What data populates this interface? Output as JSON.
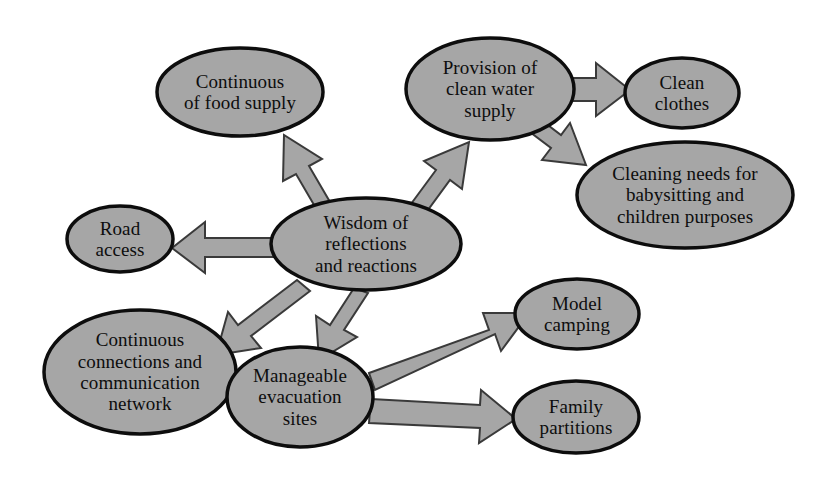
{
  "diagram": {
    "type": "concept-map",
    "title": "",
    "background_color": "#ffffff",
    "node_fill_color": "#a6a6a6",
    "node_border_color": "#0d0d0d",
    "arrow_fill_color": "#a6a6a6",
    "arrow_border_color": "#3a3a3a",
    "text_color": "#0d0d0d",
    "nodes": [
      {
        "id": "wisdom",
        "label": "Wisdom of reflections and reactions",
        "lines": [
          "Wisdom of",
          "reflections",
          "and reactions"
        ],
        "cx": 366,
        "cy": 244,
        "rx": 95,
        "ry": 46,
        "font_size": 19
      },
      {
        "id": "food",
        "label": "Continuous of food supply",
        "lines": [
          "Continuous",
          "of food supply"
        ],
        "cx": 240,
        "cy": 92,
        "rx": 83,
        "ry": 44,
        "font_size": 19
      },
      {
        "id": "water",
        "label": "Provision of clean water supply",
        "lines": [
          "Provision of",
          "clean water",
          "supply"
        ],
        "cx": 490,
        "cy": 89,
        "rx": 84,
        "ry": 51,
        "font_size": 19
      },
      {
        "id": "clothes",
        "label": "Clean clothes",
        "lines": [
          "Clean",
          "clothes"
        ],
        "cx": 682,
        "cy": 93,
        "rx": 57,
        "ry": 35,
        "font_size": 19
      },
      {
        "id": "cleaning",
        "label": "Cleaning needs for babysitting and children purposes",
        "lines": [
          "Cleaning needs for",
          "babysitting and",
          "children purposes"
        ],
        "cx": 685,
        "cy": 195,
        "rx": 108,
        "ry": 53,
        "font_size": 19
      },
      {
        "id": "road",
        "label": "Road access",
        "lines": [
          "Road",
          "access"
        ],
        "cx": 120,
        "cy": 239,
        "rx": 53,
        "ry": 33,
        "font_size": 19
      },
      {
        "id": "network",
        "label": "Continuous connections and communication network",
        "lines": [
          "Continuous",
          "connections and",
          "communication",
          "network"
        ],
        "cx": 140,
        "cy": 372,
        "rx": 96,
        "ry": 62,
        "font_size": 19
      },
      {
        "id": "evacuation",
        "label": "Manageable evacuation sites",
        "lines": [
          "Manageable",
          "evacuation",
          "sites"
        ],
        "cx": 300,
        "cy": 397,
        "rx": 73,
        "ry": 50,
        "font_size": 19
      },
      {
        "id": "camping",
        "label": "Model camping",
        "lines": [
          "Model",
          "camping"
        ],
        "cx": 577,
        "cy": 314,
        "rx": 62,
        "ry": 35,
        "font_size": 19
      },
      {
        "id": "partitions",
        "label": "Family partitions",
        "lines": [
          "Family",
          "partitions"
        ],
        "cx": 576,
        "cy": 417,
        "rx": 63,
        "ry": 36,
        "font_size": 19
      }
    ],
    "edges": [
      {
        "id": "wisdom-to-food",
        "from": "wisdom",
        "to": "food",
        "direction": "up-left"
      },
      {
        "id": "wisdom-to-water",
        "from": "wisdom",
        "to": "water",
        "direction": "up-right"
      },
      {
        "id": "wisdom-to-road",
        "from": "wisdom",
        "to": "road",
        "direction": "left"
      },
      {
        "id": "wisdom-to-network",
        "from": "wisdom",
        "to": "network",
        "direction": "down-left"
      },
      {
        "id": "wisdom-to-evacuation",
        "from": "wisdom",
        "to": "evacuation",
        "direction": "down"
      },
      {
        "id": "water-to-clothes",
        "from": "water",
        "to": "clothes",
        "direction": "right"
      },
      {
        "id": "water-to-cleaning",
        "from": "water",
        "to": "cleaning",
        "direction": "down-right"
      },
      {
        "id": "evacuation-to-camping",
        "from": "evacuation",
        "to": "camping",
        "direction": "up-right"
      },
      {
        "id": "evacuation-to-partitions",
        "from": "evacuation",
        "to": "partitions",
        "direction": "right"
      }
    ]
  }
}
